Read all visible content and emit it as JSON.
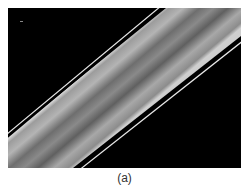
{
  "figure": {
    "caption": "(a)",
    "colors": {
      "background": "#000000",
      "edge_highlight": "#e0e0e0",
      "band_light": "#9a9a9a",
      "band_dark": "#555555"
    }
  }
}
